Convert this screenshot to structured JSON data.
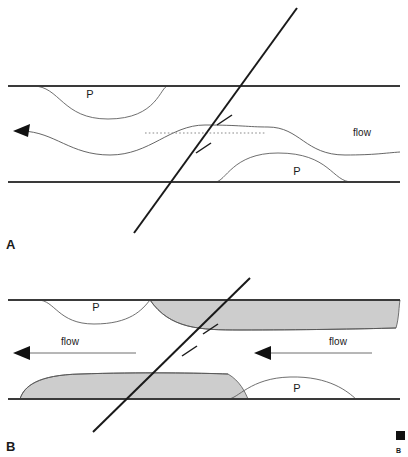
{
  "figure": {
    "background_color": "#ffffff",
    "line_color": "#1a1a1a",
    "boundary_color": "#3a3a3a",
    "curve_color": "#555555",
    "shaded_fill_color": "#cdcdcd",
    "dotted_line_color": "#8a8a8a"
  },
  "panels": [
    {
      "id": "A",
      "label": "A",
      "label_position": {
        "x": 6,
        "y": 249
      },
      "deposit_labels": [
        {
          "text": "P",
          "x": 90,
          "y": 98
        },
        {
          "text": "P",
          "x": 297,
          "y": 175
        }
      ],
      "flow_labels": [
        {
          "text": "flow",
          "x": 362,
          "y": 136
        }
      ],
      "bounding_surfaces": [
        {
          "name": "upper-bounding-surface",
          "y": 86,
          "x1": 8,
          "x2": 400
        },
        {
          "name": "lower-bounding-surface",
          "y": 182,
          "x1": 8,
          "x2": 400
        }
      ],
      "fault": {
        "x1": 134,
        "y1": 233,
        "x2": 297,
        "y2": 8,
        "tick_count": 2,
        "tick_label": "fault-slip-tick"
      },
      "dotted_datum": {
        "y": 133,
        "x1": 145,
        "x2": 265
      },
      "flow_arrow": {
        "direction": "left",
        "tip_x": 14,
        "tip_y": 131
      }
    },
    {
      "id": "B",
      "label": "B",
      "label_position": {
        "x": 6,
        "y": 451
      },
      "deposit_labels": [
        {
          "text": "P",
          "x": 96,
          "y": 311
        },
        {
          "text": "P",
          "x": 297,
          "y": 392
        }
      ],
      "flow_labels": [
        {
          "text": "flow",
          "x": 70,
          "y": 345
        },
        {
          "text": "flow",
          "x": 338,
          "y": 345
        }
      ],
      "bounding_surfaces": [
        {
          "name": "upper-bounding-surface",
          "y": 300,
          "x1": 8,
          "x2": 400
        },
        {
          "name": "lower-bounding-surface",
          "y": 399,
          "x1": 8,
          "x2": 400
        }
      ],
      "fault": {
        "x1": 93,
        "y1": 432,
        "x2": 250,
        "y2": 278,
        "tick_count": 2,
        "tick_label": "fault-slip-tick"
      },
      "flow_arrows": [
        {
          "name": "left-flow-arrow",
          "direction": "left",
          "tip_x": 14,
          "tip_y": 353,
          "tail_x": 136
        },
        {
          "name": "right-flow-arrow",
          "direction": "left",
          "tip_x": 254,
          "tip_y": 353,
          "tail_x": 372
        }
      ],
      "shaded_regions": [
        {
          "name": "upper-shaded-lens",
          "side": "right",
          "fill": "#cdcdcd"
        },
        {
          "name": "lower-shaded-lens",
          "side": "left",
          "fill": "#cdcdcd"
        }
      ]
    }
  ],
  "corner_marks": {
    "square_label": "",
    "letter_label": "B"
  }
}
